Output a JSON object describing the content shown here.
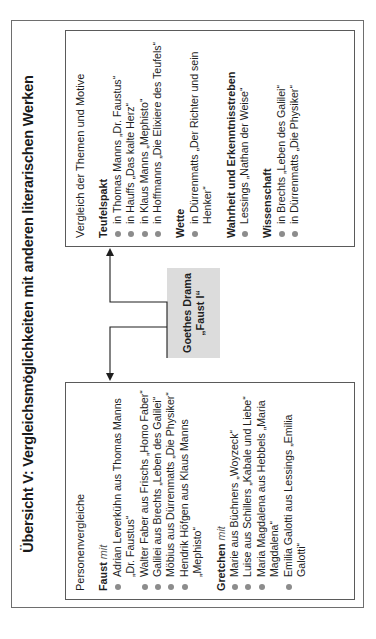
{
  "title": "Übersicht V: Vergleichsmöglichkeiten mit anderen literarischen Werken",
  "center": {
    "line1": "Goethes Drama",
    "line2": "„Faust I“",
    "fill_color": "#dcdcdc"
  },
  "left_box": {
    "heading": "Personenvergleiche",
    "groups": [
      {
        "title": "Faust",
        "suffix": "mit",
        "items": [
          "Adrian Leverkühn aus Thomas Manns „Dr. Faustus“",
          "Walter Faber aus Frischs „Homo Faber“",
          "Galilei aus Brechts „Leben des Galilei“",
          "Möbius aus Dürrenmatts „Die Physiker“",
          "Hendrik Höfgen aus Klaus Manns „Mephisto“"
        ]
      },
      {
        "title": "Gretchen",
        "suffix": "mit",
        "items": [
          "Marie aus Büchners „Woyzeck“",
          "Luise aus Schillers „Kabale und Liebe“",
          "Maria Magdalena aus Hebbels „Maria Magdalena“",
          "Emilia Galotti aus Lessings „Emilia Galotti“"
        ]
      }
    ]
  },
  "right_box": {
    "heading": "Vergleich der Themen und Motive",
    "groups": [
      {
        "title": "Teufelspakt",
        "items": [
          "in Thomas Manns „Dr. Faustus“",
          "in Hauffs „Das kalte Herz“",
          "in Klaus Manns „Mephisto“",
          "in Hoffmanns „Die Elixiere des Teufels“"
        ]
      },
      {
        "title": "Wette",
        "items": [
          "in Dürrenmatts „Der Richter und sein Henker“"
        ]
      },
      {
        "title": "Wahrheit und Erkenntnisstreben",
        "items": [
          "Lessings „Nathan der Weise“"
        ]
      },
      {
        "title": "Wissenschaft",
        "items": [
          "in Brechts „Leben des Galilei“",
          "in Dürrenmatts „Die Physiker“"
        ]
      }
    ]
  }
}
